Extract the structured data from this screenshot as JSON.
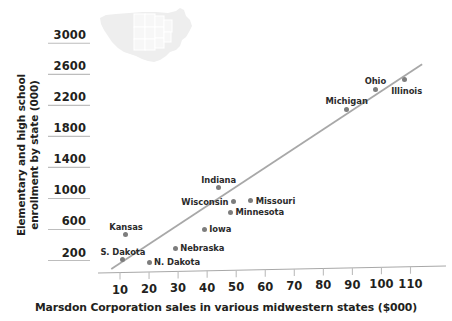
{
  "chart_data": {
    "type": "scatter",
    "title": "",
    "xlabel": "Marsdon Corporation sales in various midwestern states ($000)",
    "ylabel": "Elementary and high school enrollment by state (000)",
    "ylabel_line1": "Elementary and high school",
    "ylabel_line2": "enrollment by state (000)",
    "xlim": [
      0,
      118
    ],
    "ylim": [
      0,
      3150
    ],
    "xticks": [
      10,
      20,
      30,
      40,
      50,
      60,
      70,
      80,
      90,
      100,
      110
    ],
    "yticks": [
      200,
      600,
      1000,
      1400,
      1800,
      2200,
      2600,
      3000
    ],
    "xtick_labels": [
      "10",
      "20",
      "30",
      "40",
      "50",
      "60",
      "70",
      "80",
      "90",
      "100",
      "110"
    ],
    "ytick_labels": [
      "200",
      "600",
      "1000",
      "1400",
      "1800",
      "2200",
      "2600",
      "3000"
    ],
    "grid": false,
    "legend": null,
    "point_color": "#7d7d7d",
    "trendline_color": "#a8a8a8",
    "axis_color": "#a8a8a8",
    "text_color": "#231f20",
    "points": [
      {
        "label": "S. Dakota",
        "x": 11,
        "y": 120,
        "label_pos": "above"
      },
      {
        "label": "N. Dakota",
        "x": 20,
        "y": 90,
        "label_pos": "right"
      },
      {
        "label": "Kansas",
        "x": 12,
        "y": 440,
        "label_pos": "above"
      },
      {
        "label": "Nebraska",
        "x": 29,
        "y": 270,
        "label_pos": "right"
      },
      {
        "label": "Iowa",
        "x": 39,
        "y": 510,
        "label_pos": "right"
      },
      {
        "label": "Indiana",
        "x": 44,
        "y": 1050,
        "label_pos": "above"
      },
      {
        "label": "Wisconsin",
        "x": 49,
        "y": 870,
        "label_pos": "left"
      },
      {
        "label": "Minnesota",
        "x": 48,
        "y": 730,
        "label_pos": "right"
      },
      {
        "label": "Missouri",
        "x": 55,
        "y": 880,
        "label_pos": "right"
      },
      {
        "label": "Michigan",
        "x": 88,
        "y": 2060,
        "label_pos": "above"
      },
      {
        "label": "Ohio",
        "x": 98,
        "y": 2320,
        "label_pos": "above"
      },
      {
        "label": "Illinois",
        "x": 108,
        "y": 2440,
        "label_pos": "below"
      }
    ],
    "trendline": {
      "x0": 7,
      "y0": 0,
      "x1": 114,
      "y1": 2640
    },
    "annotations": [
      {
        "name": "us-map-watermark",
        "description": "faint outline map of the United States with midwestern states highlighted"
      }
    ]
  }
}
